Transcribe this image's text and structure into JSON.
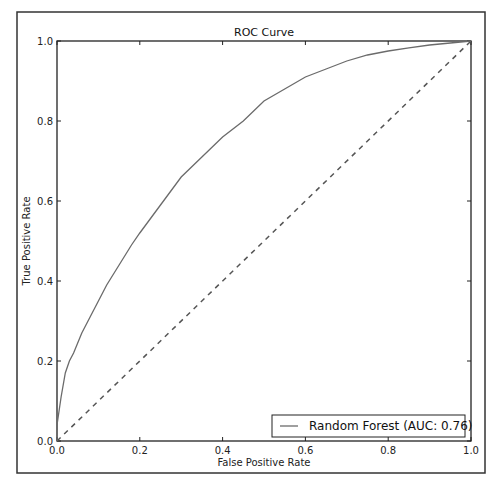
{
  "chart_data": {
    "type": "line",
    "title": "ROC Curve",
    "xlabel": "False Positive Rate",
    "ylabel": "True Positive Rate",
    "xlim": [
      0.0,
      1.0
    ],
    "ylim": [
      0.0,
      1.0
    ],
    "xticks": [
      "0.0",
      "0.2",
      "0.4",
      "0.6",
      "0.8",
      "1.0"
    ],
    "yticks": [
      "0.0",
      "0.2",
      "0.4",
      "0.6",
      "0.8",
      "1.0"
    ],
    "grid": false,
    "legend_position": "lower right",
    "series": [
      {
        "name": "Random Forest (AUC: 0.76)",
        "style": "solid",
        "color": "#6b6b6b",
        "x": [
          0.0,
          0.0,
          0.01,
          0.02,
          0.03,
          0.04,
          0.06,
          0.08,
          0.1,
          0.12,
          0.15,
          0.18,
          0.2,
          0.25,
          0.3,
          0.35,
          0.4,
          0.45,
          0.5,
          0.55,
          0.6,
          0.65,
          0.7,
          0.75,
          0.8,
          0.85,
          0.9,
          0.95,
          1.0
        ],
        "y": [
          0.0,
          0.04,
          0.11,
          0.17,
          0.2,
          0.22,
          0.27,
          0.31,
          0.35,
          0.39,
          0.44,
          0.49,
          0.52,
          0.59,
          0.66,
          0.71,
          0.76,
          0.8,
          0.85,
          0.88,
          0.91,
          0.93,
          0.95,
          0.965,
          0.975,
          0.983,
          0.99,
          0.995,
          1.0
        ]
      },
      {
        "name": "Chance",
        "style": "dashed",
        "color": "#555555",
        "x": [
          0.0,
          1.0
        ],
        "y": [
          0.0,
          1.0
        ]
      }
    ],
    "legend": [
      "Random Forest (AUC: 0.76)"
    ]
  },
  "colors": {
    "axes": "#222222",
    "frame": "#333333",
    "curve": "#6b6b6b",
    "diagonal": "#555555"
  }
}
